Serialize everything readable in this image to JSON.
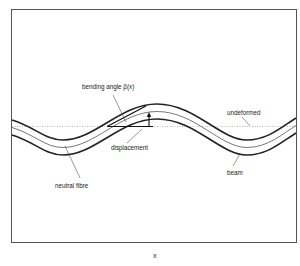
{
  "diagram": {
    "labels": {
      "bending_angle": "bending angle β(x)",
      "undeformed": "undeformed",
      "displacement": "displacement",
      "neutral_fibre": "neutral fibre",
      "beam": "beam",
      "x_axis": "x"
    },
    "colors": {
      "frame": "#555555",
      "beam_edge": "#222222",
      "neutral_fibre": "#555555",
      "undeformed": "#999999",
      "leader": "#444444",
      "text": "#222222"
    }
  }
}
